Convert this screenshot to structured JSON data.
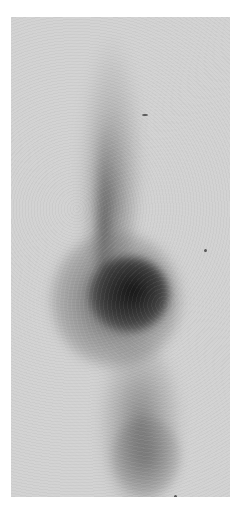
{
  "image": {
    "kind": "grayscale nuclear medicine scan",
    "background_color": "#ffffff",
    "film_color": "#d2d2d2",
    "hotspot_color": "#0f0f0f",
    "regions": [
      {
        "name": "upper-band",
        "description": "narrow vertical band of moderate uptake"
      },
      {
        "name": "central-hotspot",
        "description": "dense dark focal uptake, mid-image"
      },
      {
        "name": "lower-band",
        "description": "tapered band of moderate uptake"
      }
    ]
  }
}
